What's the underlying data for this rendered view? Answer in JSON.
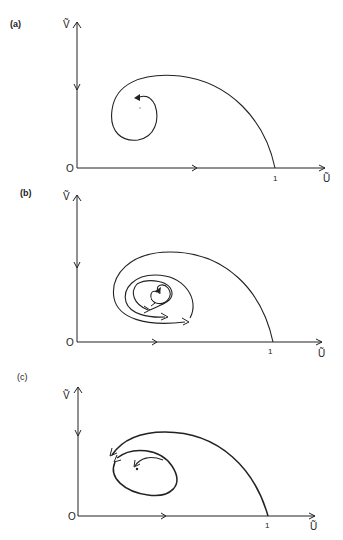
{
  "figure": {
    "panels": [
      {
        "id": "a",
        "label": "(a)",
        "y_axis_label": "Ṽ",
        "x_axis_label": "Ũ",
        "origin_label": "O",
        "x_tick_label": "1",
        "description": "Single trajectory from (1,0) spiralling inward toward an interior point; stable focus"
      },
      {
        "id": "b",
        "label": "(b)",
        "y_axis_label": "Ṽ",
        "x_axis_label": "Ũ",
        "origin_label": "O",
        "x_tick_label": "1",
        "description": "Trajectory from (1,0) winding into nested closed orbits around interior point; neutral centre / limit cycles"
      },
      {
        "id": "c",
        "label": "(c)",
        "y_axis_label": "Ṽ",
        "x_axis_label": "Ũ",
        "origin_label": "O",
        "x_tick_label": "1",
        "description": "Trajectory from (1,0) and inner orbit circulating around interior point with arrows; unstable focus approaching a limit cycle"
      }
    ]
  }
}
